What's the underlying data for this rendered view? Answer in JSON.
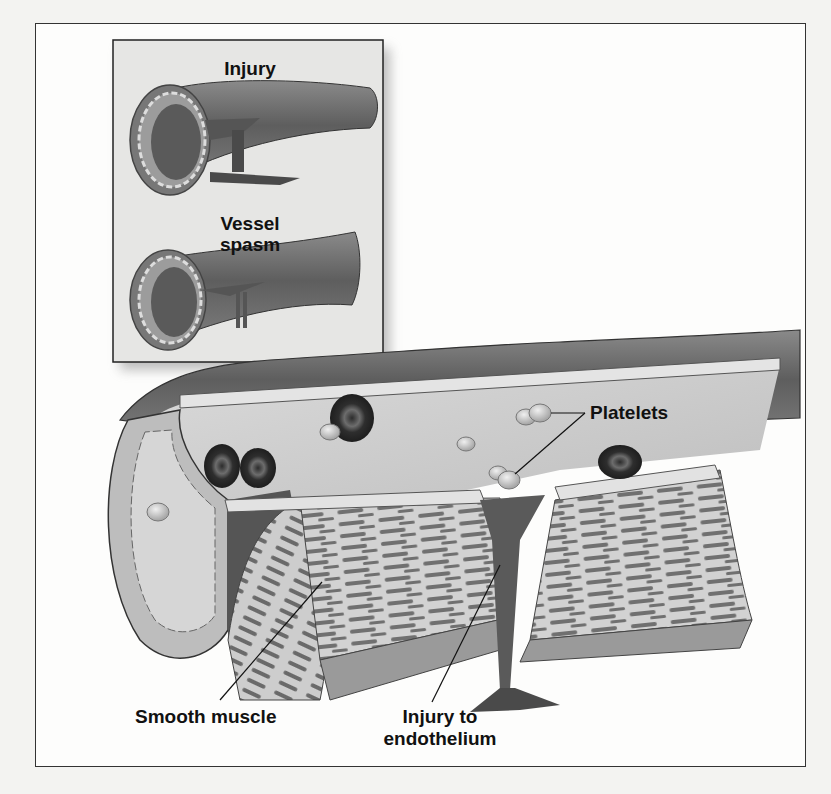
{
  "figure": {
    "inset": {
      "panels": [
        {
          "label": "Injury"
        },
        {
          "label_line1": "Vessel",
          "label_line2": "spasm"
        }
      ]
    },
    "labels": {
      "platelets": "Platelets",
      "smooth_muscle": "Smooth muscle",
      "injury_line1": "Injury to",
      "injury_line2": "endothelium"
    },
    "colors": {
      "vessel_dark": "#6b6b6b",
      "vessel_mid": "#9a9a9a",
      "lumen": "#c9c9c9",
      "red_cell": "#3a3a3a",
      "inset_bg": "#e6e6e4",
      "page_bg": "#f3f3f1"
    }
  }
}
